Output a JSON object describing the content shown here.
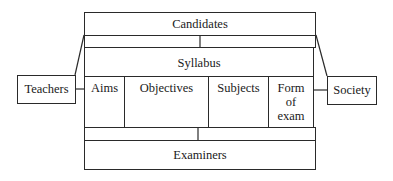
{
  "diagram": {
    "top": {
      "label": "Candidates"
    },
    "center": {
      "label": "Syllabus",
      "components": [
        {
          "label": "Aims"
        },
        {
          "label": "Objectives"
        },
        {
          "label": "Subjects"
        },
        {
          "label": "Form\nof\nexam",
          "lines": [
            "Form",
            "of",
            "exam"
          ]
        }
      ]
    },
    "left": {
      "label": "Teachers"
    },
    "right": {
      "label": "Society"
    },
    "bottom": {
      "label": "Examiners"
    }
  }
}
